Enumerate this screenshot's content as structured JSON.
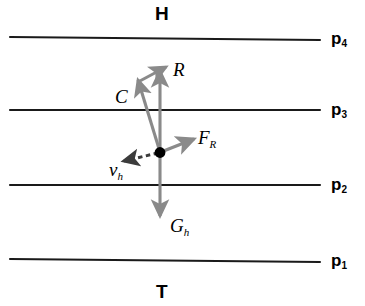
{
  "figure": {
    "width": 365,
    "height": 306,
    "background": "#ffffff",
    "type": "force-vector-diagram"
  },
  "regions": {
    "top_label": "H",
    "bottom_label": "T"
  },
  "planes": [
    {
      "name": "p4",
      "label_base": "p",
      "label_sub": "4",
      "y": 38
    },
    {
      "name": "p3",
      "label_base": "p",
      "label_sub": "3",
      "y": 110
    },
    {
      "name": "p2",
      "label_base": "p",
      "label_sub": "2",
      "y": 185
    },
    {
      "name": "p1",
      "label_base": "p",
      "label_sub": "1",
      "y": 260
    }
  ],
  "origin": {
    "label": "origin-point",
    "x": 160,
    "y": 152
  },
  "vectors": [
    {
      "name": "R",
      "label_base": "R",
      "label_sub": "",
      "style": "solid",
      "color": "#8a8a8a",
      "description": "resultant, diagonal up-right from C tip"
    },
    {
      "name": "C",
      "label_base": "C",
      "label_sub": "",
      "style": "solid",
      "color": "#8a8a8a",
      "description": "up-left from origin"
    },
    {
      "name": "R_vertical",
      "label_base": "",
      "label_sub": "",
      "style": "solid",
      "color": "#8a8a8a",
      "description": "vertical component upward from origin"
    },
    {
      "name": "FR",
      "label_base": "F",
      "label_sub": "R",
      "style": "solid",
      "color": "#8a8a8a",
      "description": "up-right short vector from origin"
    },
    {
      "name": "vh",
      "label_base": "v",
      "label_sub": "h",
      "style": "dashed",
      "color": "#4a4a4a",
      "description": "dashed vector down-left from origin"
    },
    {
      "name": "Gh",
      "label_base": "G",
      "label_sub": "h",
      "style": "solid",
      "color": "#8a8a8a",
      "description": "downward weight vector from origin"
    }
  ],
  "colors": {
    "plane_line": "#1a1a1a",
    "vector_gray": "#8a8a8a",
    "vector_dark": "#3c3c3c",
    "text": "#000000",
    "dot": "#000000"
  }
}
